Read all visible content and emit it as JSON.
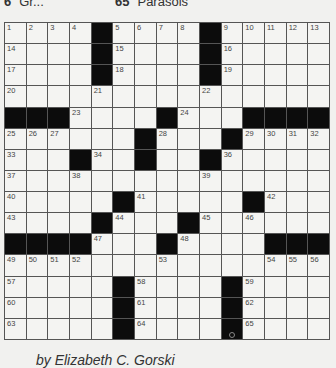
{
  "header_clues": [
    {
      "number": "6",
      "text": "Gr..."
    },
    {
      "number": "65",
      "text": "Parasols"
    }
  ],
  "puzzle": {
    "rows": 15,
    "cols": 15,
    "grid": [
      "....#....#.....",
      "....#....#.....",
      "....#....#.....",
      "...............",
      "###....#...####",
      "......#...#....",
      "...#..#..#.....",
      "...............",
      ".....#.....#...",
      "....#...#......",
      "####...#....###",
      "...............",
      ".....#....#....",
      ".....#....#....",
      ".....#....#...."
    ],
    "numbers": [
      [
        1,
        2,
        3,
        4,
        0,
        5,
        6,
        7,
        8,
        0,
        9,
        10,
        11,
        12,
        13
      ],
      [
        14,
        0,
        0,
        0,
        0,
        15,
        0,
        0,
        0,
        0,
        16,
        0,
        0,
        0,
        0
      ],
      [
        17,
        0,
        0,
        0,
        0,
        18,
        0,
        0,
        0,
        0,
        19,
        0,
        0,
        0,
        0
      ],
      [
        20,
        0,
        0,
        0,
        21,
        0,
        0,
        0,
        0,
        22,
        0,
        0,
        0,
        0,
        0
      ],
      [
        0,
        0,
        0,
        23,
        0,
        0,
        0,
        0,
        24,
        0,
        0,
        0,
        0,
        0,
        0
      ],
      [
        25,
        26,
        27,
        0,
        0,
        0,
        0,
        28,
        0,
        0,
        0,
        29,
        30,
        31,
        32
      ],
      [
        33,
        0,
        0,
        0,
        34,
        0,
        35,
        0,
        0,
        0,
        36,
        0,
        0,
        0,
        0
      ],
      [
        37,
        0,
        0,
        38,
        0,
        0,
        0,
        0,
        0,
        39,
        0,
        0,
        0,
        0,
        0
      ],
      [
        40,
        0,
        0,
        0,
        0,
        0,
        41,
        0,
        0,
        0,
        0,
        0,
        42,
        0,
        0
      ],
      [
        43,
        0,
        0,
        0,
        0,
        44,
        0,
        0,
        0,
        45,
        0,
        46,
        0,
        0,
        0
      ],
      [
        0,
        0,
        0,
        0,
        47,
        0,
        0,
        0,
        48,
        0,
        0,
        0,
        0,
        0,
        0
      ],
      [
        49,
        50,
        51,
        52,
        0,
        0,
        0,
        53,
        0,
        0,
        0,
        0,
        54,
        55,
        56
      ],
      [
        57,
        0,
        0,
        0,
        0,
        0,
        58,
        0,
        0,
        0,
        0,
        59,
        0,
        0,
        0
      ],
      [
        60,
        0,
        0,
        0,
        0,
        0,
        61,
        0,
        0,
        0,
        0,
        62,
        0,
        0,
        0
      ],
      [
        63,
        0,
        0,
        0,
        0,
        0,
        64,
        0,
        0,
        0,
        0,
        65,
        0,
        0,
        0
      ]
    ],
    "colors": {
      "black_square": "#0c0c0c",
      "white_square": "#f4f4f2",
      "grid_line": "#555555"
    }
  },
  "byline": "by Elizabeth C. Gorski"
}
